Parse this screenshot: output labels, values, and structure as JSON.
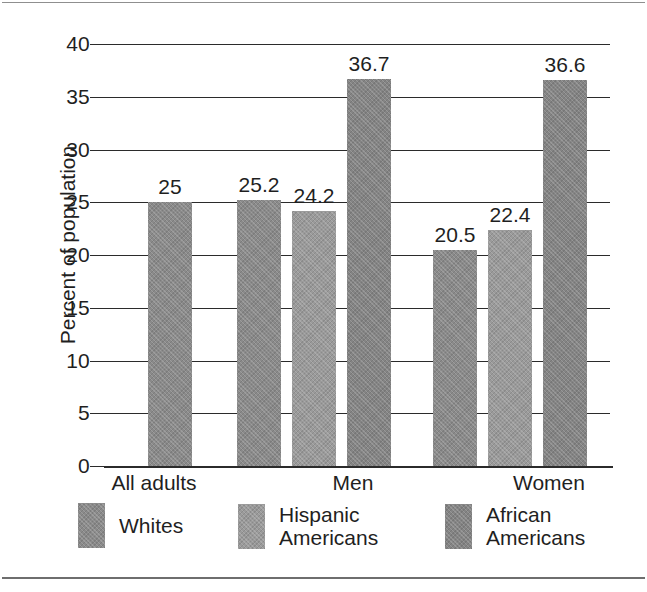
{
  "chart_data": {
    "type": "bar",
    "title": "",
    "xlabel": "",
    "ylabel": "Percent of population",
    "ylim": [
      0,
      40
    ],
    "yticks": [
      "0",
      "5",
      "10",
      "15",
      "20",
      "25",
      "30",
      "35",
      "40"
    ],
    "grid": true,
    "legend_position": "bottom",
    "categories": [
      "All adults",
      "Men",
      "Women"
    ],
    "series": [
      {
        "name": "Whites",
        "color": "#8a8a8a",
        "values": [
          25,
          25.2,
          20.5
        ],
        "labels": [
          "25",
          "25.2",
          "20.5"
        ]
      },
      {
        "name": "Hispanic\nAmericans",
        "color": "#9a9a9a",
        "values": [
          null,
          24.2,
          22.4
        ],
        "labels": [
          null,
          "24.2",
          "22.4"
        ]
      },
      {
        "name": "African\nAmericans",
        "color": "#848484",
        "values": [
          null,
          36.7,
          36.6
        ],
        "labels": [
          null,
          "36.7",
          "36.6"
        ]
      }
    ],
    "bars": [
      {
        "group": "All adults",
        "series": "Whites",
        "value": 25,
        "label": "25",
        "x": 42,
        "width": 44,
        "shade": "shade-mid"
      },
      {
        "group": "Men",
        "series": "Whites",
        "value": 25.2,
        "label": "25.2",
        "x": 131,
        "width": 44,
        "shade": "shade-mid"
      },
      {
        "group": "Men",
        "series": "Hispanic Americans",
        "value": 24.2,
        "label": "24.2",
        "x": 186,
        "width": 44,
        "shade": "shade-light"
      },
      {
        "group": "Men",
        "series": "African Americans",
        "value": 36.7,
        "label": "36.7",
        "x": 241,
        "width": 44,
        "shade": "shade-dark"
      },
      {
        "group": "Women",
        "series": "Whites",
        "value": 20.5,
        "label": "20.5",
        "x": 327,
        "width": 44,
        "shade": "shade-mid"
      },
      {
        "group": "Women",
        "series": "Hispanic Americans",
        "value": 22.4,
        "label": "22.4",
        "x": 382,
        "width": 44,
        "shade": "shade-light"
      },
      {
        "group": "Women",
        "series": "African Americans",
        "value": 36.6,
        "label": "36.6",
        "x": 437,
        "width": 44,
        "shade": "shade-dark"
      }
    ],
    "category_positions": [
      64,
      263,
      459
    ],
    "legend_positions": [
      78,
      238,
      445
    ]
  }
}
